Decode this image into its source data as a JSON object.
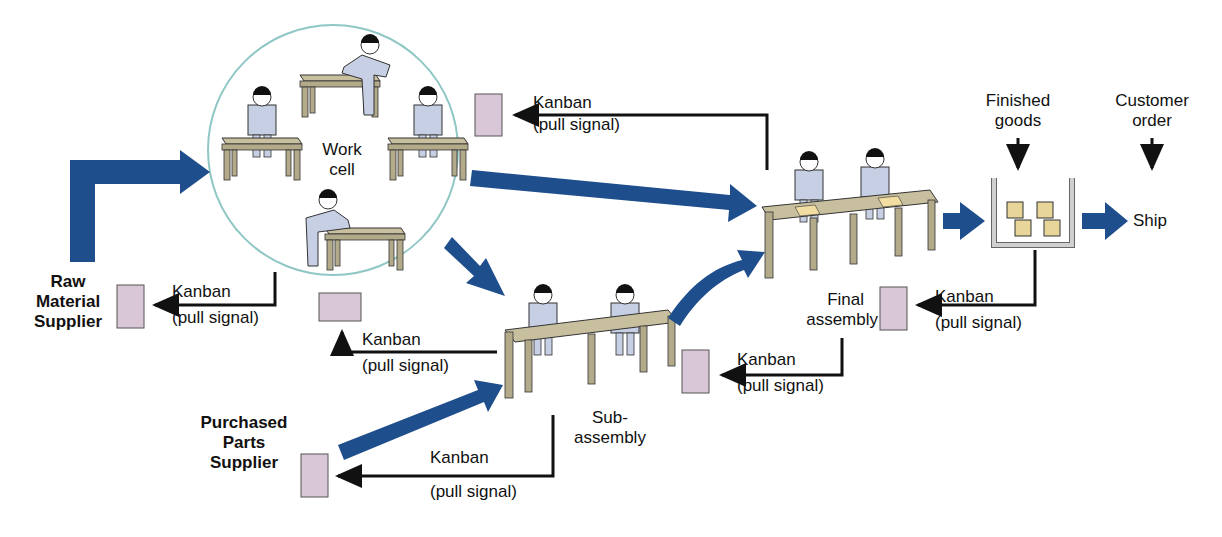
{
  "colors": {
    "flow_arrow": "#1f4e8c",
    "kanban_card": "#d9c6d6",
    "table_top": "#c8bf9f",
    "worker": "#c6cfe4",
    "work_cell_ring": "#8fc7c4",
    "signal_line": "#111111"
  },
  "stations": {
    "raw_material": {
      "line1": "Raw",
      "line2": "Material",
      "line3": "Supplier"
    },
    "purchased_parts": {
      "line1": "Purchased",
      "line2": "Parts",
      "line3": "Supplier"
    },
    "work_cell": {
      "line1": "Work",
      "line2": "cell"
    },
    "subassembly": {
      "line1": "Sub-",
      "line2": "assembly"
    },
    "final_assembly": {
      "line1": "Final",
      "line2": "assembly"
    },
    "finished_goods": {
      "line1": "Finished",
      "line2": "goods"
    },
    "customer_order": {
      "line1": "Customer",
      "line2": "order"
    },
    "ship": "Ship"
  },
  "kanban_signals": [
    {
      "title": "Kanban",
      "sub": "(pull signal)",
      "from": "Final assembly",
      "to": "Work cell"
    },
    {
      "title": "Kanban",
      "sub": "(pull signal)",
      "from": "Work cell",
      "to": "Raw Material Supplier"
    },
    {
      "title": "Kanban",
      "sub": "(pull signal)",
      "from": "Sub-assembly",
      "to": "Work cell"
    },
    {
      "title": "Kanban",
      "sub": "(pull signal)",
      "from": "Finished goods",
      "to": "Final assembly"
    },
    {
      "title": "Kanban",
      "sub": "(pull signal)",
      "from": "Final assembly",
      "to": "Sub-assembly"
    },
    {
      "title": "Kanban",
      "sub": "(pull signal)",
      "from": "Sub-assembly",
      "to": "Purchased Parts Supplier"
    }
  ]
}
